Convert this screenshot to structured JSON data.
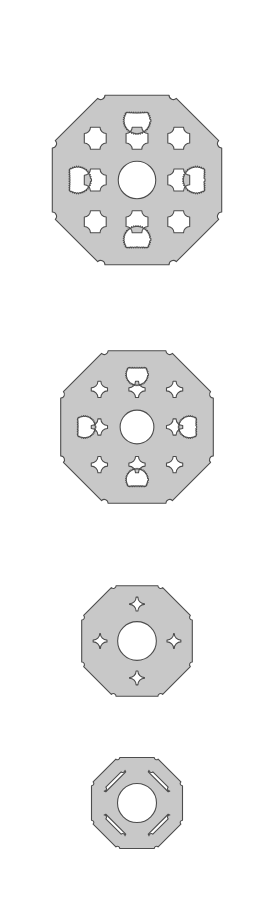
{
  "figure": {
    "background_color": "#ffffff",
    "canvas": {
      "width": 273,
      "height": 904
    },
    "style": {
      "fill_color": "#c8c8c8",
      "stroke_color": "#4d4d4d",
      "stroke_width": 1.1
    },
    "parts": [
      {
        "name": "plate-size-1",
        "label": "Largest plate",
        "center_x": 137,
        "center_y": 180,
        "outer_radius": 121,
        "corner_cut": 0.3,
        "strut": 0.082,
        "center_hole_radius": 0.155,
        "edge_hole_radius": 0.115,
        "grid_pitch": 0.345,
        "hole_count": 17,
        "ring_count": 2
      },
      {
        "name": "plate-size-2",
        "label": "Second plate",
        "center_x": 137,
        "center_y": 427,
        "outer_radius": 109,
        "corner_cut": 0.3,
        "strut": 0.098,
        "center_hole_radius": 0.155,
        "edge_hole_radius": 0.105,
        "grid_pitch": 0.345,
        "hole_count": 17,
        "ring_count": 2
      },
      {
        "name": "plate-size-3",
        "label": "Third plate",
        "center_x": 137,
        "center_y": 641,
        "outer_radius": 79,
        "corner_cut": 0.3,
        "strut": 0.135,
        "center_hole_radius": 0.245,
        "edge_hole_radius": 0.0,
        "grid_pitch": 0.46,
        "hole_count": 13,
        "ring_count": 1
      },
      {
        "name": "plate-size-4",
        "label": "Smallest plate",
        "center_x": 137,
        "center_y": 803,
        "outer_radius": 65,
        "corner_cut": 0.3,
        "strut": 0.17,
        "center_hole_radius": 0.3,
        "edge_hole_radius": 0.0,
        "grid_pitch": 0.0,
        "hole_count": 5,
        "ring_count": 0
      }
    ]
  }
}
